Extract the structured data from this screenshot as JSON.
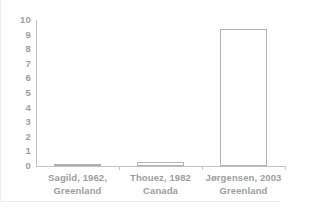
{
  "chart_data": {
    "type": "bar",
    "title": "",
    "xlabel": "",
    "ylabel": "",
    "ylim": [
      0,
      10
    ],
    "yticks": [
      "0",
      "1",
      "2",
      "3",
      "4",
      "5",
      "6",
      "7",
      "8",
      "9",
      "10"
    ],
    "grid": false,
    "legend": null,
    "categories": [
      "Sagild, 1962, Greenland",
      "Thouez, 1982 Canada",
      "Jørgensen, 2003 Greenland"
    ],
    "category_lines": [
      [
        "Sagild, 1962,",
        "Greenland"
      ],
      [
        "Thouez, 1982",
        "Canada"
      ],
      [
        "Jørgensen, 2003",
        "Greenland"
      ]
    ],
    "values": [
      0.05,
      0.3,
      9.4
    ],
    "colors": {
      "bar_fill": "#ffffff",
      "bar_outline": "#b2b2b2",
      "flat_bar_fill": "#bdbdbd",
      "axis": "#c2c2c2",
      "tick_label": "#9d9d9d",
      "background": "#ffffff",
      "frame": "#ededed"
    }
  }
}
